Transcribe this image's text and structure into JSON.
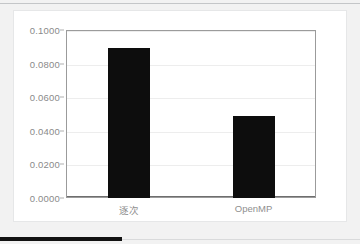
{
  "chart_data": {
    "type": "bar",
    "title": "",
    "xlabel": "",
    "ylabel": "",
    "categories": [
      "逐次",
      "OpenMP"
    ],
    "values": [
      0.089,
      0.049
    ],
    "ylim": [
      0.0,
      0.1
    ],
    "ytick_values": [
      0.0,
      0.02,
      0.04,
      0.06,
      0.08,
      0.1
    ],
    "ytick_labels": [
      "0.0000",
      "0.0200",
      "0.0400",
      "0.0600",
      "0.0800",
      "0.1000"
    ],
    "grid": "horizontal",
    "legend": "none",
    "series": [
      {
        "name": "",
        "values": [
          0.089,
          0.049
        ]
      }
    ],
    "bar_color": "#0d0d0d",
    "gridline_color": "#ededed",
    "axis_color": "#9b9b9b",
    "tick_label_color": "#8a8a8a",
    "plot_background": "#ffffff",
    "page_background": "#f2f2f2"
  },
  "decorations": {
    "top_rule_color": "#c4c6c8",
    "bottom_rule_dark_color": "#121212",
    "bottom_rule_light_color": "#d9dadb"
  }
}
